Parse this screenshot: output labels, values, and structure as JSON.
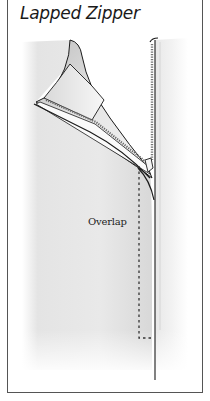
{
  "figure": {
    "title": "Lapped Zipper",
    "labels": {
      "overlap": "Overlap"
    },
    "illustration": {
      "subject": "lapped-zipper-diagram",
      "elements": [
        "fabric-left-panel",
        "folded-back-lap-flap",
        "zipper-tape-teeth",
        "zipper-pull",
        "fabric-right-panel",
        "stitching-line-dashed",
        "seam-line"
      ]
    },
    "colors": {
      "fabric_shade": "#dcdcdc",
      "outline": "#1a1a1a",
      "frame": "#555555",
      "background": "#ffffff"
    }
  }
}
